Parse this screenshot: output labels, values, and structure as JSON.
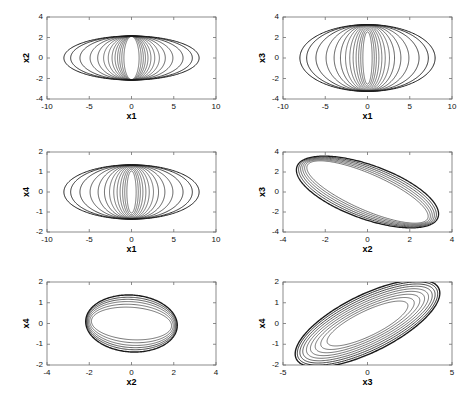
{
  "figure": {
    "width": 471,
    "height": 401,
    "background": "#ffffff",
    "line_color": "#1a1a1a",
    "axis_color": "#6f6f6f",
    "rows": 3,
    "cols": 2
  },
  "chart_data": [
    {
      "id": "panel-x1-x2",
      "type": "line",
      "title": "",
      "xlabel": "x1",
      "ylabel": "x2",
      "xlim": [
        -10,
        10
      ],
      "ylim": [
        -4,
        4
      ],
      "xticks": [
        -10,
        -5,
        0,
        5,
        10
      ],
      "yticks": [
        -4,
        -2,
        0,
        2,
        4
      ],
      "xticklabels": [
        "-10",
        "-5",
        "0",
        "5",
        "10"
      ],
      "yticklabels": [
        "-4",
        "-2",
        "0",
        "2",
        "4"
      ],
      "grid": false,
      "legend": "none",
      "description": "Family of nested phase-plane ellipses, all sharing y semi-axis near 2.15, x semi-axis growing from 0.9 to 8.0",
      "series": [
        {
          "name": "orbit-01",
          "shape": "ellipse",
          "cx": 0,
          "cy": 0,
          "rx": 0.9,
          "ry": 2.1,
          "angle": 0,
          "lw": 0.6
        },
        {
          "name": "orbit-02",
          "shape": "ellipse",
          "cx": 0,
          "cy": 0,
          "rx": 1.15,
          "ry": 2.12,
          "angle": 0,
          "lw": 0.6
        },
        {
          "name": "orbit-03",
          "shape": "ellipse",
          "cx": 0,
          "cy": 0,
          "rx": 1.4,
          "ry": 2.13,
          "angle": 0,
          "lw": 0.6
        },
        {
          "name": "orbit-04",
          "shape": "ellipse",
          "cx": 0,
          "cy": 0,
          "rx": 1.65,
          "ry": 2.14,
          "angle": 0,
          "lw": 0.6
        },
        {
          "name": "orbit-05",
          "shape": "ellipse",
          "cx": 0,
          "cy": 0,
          "rx": 1.95,
          "ry": 2.14,
          "angle": 0,
          "lw": 0.6
        },
        {
          "name": "orbit-06",
          "shape": "ellipse",
          "cx": 0,
          "cy": 0,
          "rx": 2.3,
          "ry": 2.15,
          "angle": 0,
          "lw": 0.6
        },
        {
          "name": "orbit-07",
          "shape": "ellipse",
          "cx": 0,
          "cy": 0,
          "rx": 2.75,
          "ry": 2.15,
          "angle": 0,
          "lw": 0.6
        },
        {
          "name": "orbit-08",
          "shape": "ellipse",
          "cx": 0,
          "cy": 0,
          "rx": 3.3,
          "ry": 2.15,
          "angle": 0,
          "lw": 0.6
        },
        {
          "name": "orbit-09",
          "shape": "ellipse",
          "cx": 0,
          "cy": 0,
          "rx": 4.0,
          "ry": 2.15,
          "angle": 0,
          "lw": 0.7
        },
        {
          "name": "orbit-10",
          "shape": "ellipse",
          "cx": 0,
          "cy": 0,
          "rx": 4.9,
          "ry": 2.15,
          "angle": 0,
          "lw": 0.7
        },
        {
          "name": "orbit-11",
          "shape": "ellipse",
          "cx": 0,
          "cy": 0,
          "rx": 6.1,
          "ry": 2.15,
          "angle": 0,
          "lw": 0.8
        },
        {
          "name": "orbit-12",
          "shape": "ellipse",
          "cx": 0,
          "cy": 0,
          "rx": 7.2,
          "ry": 2.15,
          "angle": 0,
          "lw": 0.9
        },
        {
          "name": "orbit-13",
          "shape": "ellipse",
          "cx": 0,
          "cy": 0,
          "rx": 8.0,
          "ry": 2.15,
          "angle": 0,
          "lw": 1.0
        }
      ]
    },
    {
      "id": "panel-x1-x3",
      "type": "line",
      "title": "",
      "xlabel": "x1",
      "ylabel": "x3",
      "xlim": [
        -10,
        10
      ],
      "ylim": [
        -4,
        4
      ],
      "xticks": [
        -10,
        -5,
        0,
        5,
        10
      ],
      "yticks": [
        -4,
        -2,
        0,
        2,
        4
      ],
      "xticklabels": [
        "-10",
        "-5",
        "0",
        "5",
        "10"
      ],
      "yticklabels": [
        "-4",
        "-2",
        "0",
        "2",
        "4"
      ],
      "grid": false,
      "legend": "none",
      "description": "Nested ellipses sharing y semi-axis near 3.25, x semi-axis growing from 0.55 to 8.0",
      "series": [
        {
          "name": "orbit-01",
          "shape": "ellipse",
          "cx": 0,
          "cy": 0,
          "rx": 0.55,
          "ry": 2.55,
          "angle": 0,
          "lw": 0.6
        },
        {
          "name": "orbit-02",
          "shape": "ellipse",
          "cx": 0,
          "cy": 0,
          "rx": 0.8,
          "ry": 2.75,
          "angle": 0,
          "lw": 0.6
        },
        {
          "name": "orbit-03",
          "shape": "ellipse",
          "cx": 0,
          "cy": 0,
          "rx": 1.05,
          "ry": 2.92,
          "angle": 0,
          "lw": 0.6
        },
        {
          "name": "orbit-04",
          "shape": "ellipse",
          "cx": 0,
          "cy": 0,
          "rx": 1.35,
          "ry": 3.05,
          "angle": 0,
          "lw": 0.6
        },
        {
          "name": "orbit-05",
          "shape": "ellipse",
          "cx": 0,
          "cy": 0,
          "rx": 1.7,
          "ry": 3.13,
          "angle": 0,
          "lw": 0.6
        },
        {
          "name": "orbit-06",
          "shape": "ellipse",
          "cx": 0,
          "cy": 0,
          "rx": 2.1,
          "ry": 3.18,
          "angle": 0,
          "lw": 0.6
        },
        {
          "name": "orbit-07",
          "shape": "ellipse",
          "cx": 0,
          "cy": 0,
          "rx": 2.6,
          "ry": 3.21,
          "angle": 0,
          "lw": 0.6
        },
        {
          "name": "orbit-08",
          "shape": "ellipse",
          "cx": 0,
          "cy": 0,
          "rx": 3.2,
          "ry": 3.23,
          "angle": 0,
          "lw": 0.7
        },
        {
          "name": "orbit-09",
          "shape": "ellipse",
          "cx": 0,
          "cy": 0,
          "rx": 3.95,
          "ry": 3.24,
          "angle": 0,
          "lw": 0.7
        },
        {
          "name": "orbit-10",
          "shape": "ellipse",
          "cx": 0,
          "cy": 0,
          "rx": 4.9,
          "ry": 3.25,
          "angle": 0,
          "lw": 0.7
        },
        {
          "name": "orbit-11",
          "shape": "ellipse",
          "cx": 0,
          "cy": 0,
          "rx": 6.1,
          "ry": 3.25,
          "angle": 0,
          "lw": 0.8
        },
        {
          "name": "orbit-12",
          "shape": "ellipse",
          "cx": 0,
          "cy": 0,
          "rx": 7.2,
          "ry": 3.26,
          "angle": 0,
          "lw": 0.9
        },
        {
          "name": "orbit-13",
          "shape": "ellipse",
          "cx": 0,
          "cy": 0,
          "rx": 8.0,
          "ry": 3.26,
          "angle": 0,
          "lw": 1.0
        }
      ]
    },
    {
      "id": "panel-x1-x4",
      "type": "line",
      "title": "",
      "xlabel": "x1",
      "ylabel": "x4",
      "xlim": [
        -10,
        10
      ],
      "ylim": [
        -2,
        2
      ],
      "xticks": [
        -10,
        -5,
        0,
        5,
        10
      ],
      "yticks": [
        -2,
        -1,
        0,
        1,
        2
      ],
      "xticklabels": [
        "-10",
        "-5",
        "0",
        "5",
        "10"
      ],
      "yticklabels": [
        "-2",
        "-1",
        "0",
        "1",
        "2"
      ],
      "grid": false,
      "legend": "none",
      "description": "Nested ellipses sharing y semi-axis near 1.35, x semi-axis growing from 0.55 to 8.0",
      "series": [
        {
          "name": "orbit-01",
          "shape": "ellipse",
          "cx": 0,
          "cy": 0,
          "rx": 0.55,
          "ry": 1.05,
          "angle": 0,
          "lw": 0.6
        },
        {
          "name": "orbit-02",
          "shape": "ellipse",
          "cx": 0,
          "cy": 0,
          "rx": 0.8,
          "ry": 1.14,
          "angle": 0,
          "lw": 0.6
        },
        {
          "name": "orbit-03",
          "shape": "ellipse",
          "cx": 0,
          "cy": 0,
          "rx": 1.05,
          "ry": 1.21,
          "angle": 0,
          "lw": 0.6
        },
        {
          "name": "orbit-04",
          "shape": "ellipse",
          "cx": 0,
          "cy": 0,
          "rx": 1.35,
          "ry": 1.26,
          "angle": 0,
          "lw": 0.6
        },
        {
          "name": "orbit-05",
          "shape": "ellipse",
          "cx": 0,
          "cy": 0,
          "rx": 1.7,
          "ry": 1.3,
          "angle": 0,
          "lw": 0.6
        },
        {
          "name": "orbit-06",
          "shape": "ellipse",
          "cx": 0,
          "cy": 0,
          "rx": 2.1,
          "ry": 1.32,
          "angle": 0,
          "lw": 0.6
        },
        {
          "name": "orbit-07",
          "shape": "ellipse",
          "cx": 0,
          "cy": 0,
          "rx": 2.6,
          "ry": 1.33,
          "angle": 0,
          "lw": 0.6
        },
        {
          "name": "orbit-08",
          "shape": "ellipse",
          "cx": 0,
          "cy": 0,
          "rx": 3.2,
          "ry": 1.34,
          "angle": 0,
          "lw": 0.7
        },
        {
          "name": "orbit-09",
          "shape": "ellipse",
          "cx": 0,
          "cy": 0,
          "rx": 3.95,
          "ry": 1.35,
          "angle": 0,
          "lw": 0.7
        },
        {
          "name": "orbit-10",
          "shape": "ellipse",
          "cx": 0,
          "cy": 0,
          "rx": 4.9,
          "ry": 1.35,
          "angle": 0,
          "lw": 0.7
        },
        {
          "name": "orbit-11",
          "shape": "ellipse",
          "cx": 0,
          "cy": 0,
          "rx": 6.1,
          "ry": 1.35,
          "angle": 0,
          "lw": 0.8
        },
        {
          "name": "orbit-12",
          "shape": "ellipse",
          "cx": 0,
          "cy": 0,
          "rx": 7.2,
          "ry": 1.36,
          "angle": 0,
          "lw": 0.9
        },
        {
          "name": "orbit-13",
          "shape": "ellipse",
          "cx": 0,
          "cy": 0,
          "rx": 8.0,
          "ry": 1.36,
          "angle": 0,
          "lw": 1.0
        }
      ]
    },
    {
      "id": "panel-x2-x3",
      "type": "line",
      "title": "",
      "xlabel": "x2",
      "ylabel": "x3",
      "xlim": [
        -4,
        4
      ],
      "ylim": [
        -4,
        4
      ],
      "xticks": [
        -4,
        -2,
        0,
        2,
        4
      ],
      "yticks": [
        -4,
        -2,
        0,
        2,
        4
      ],
      "xticklabels": [
        "-4",
        "-2",
        "0",
        "2",
        "4"
      ],
      "yticklabels": [
        "-4",
        "-2",
        "0",
        "2",
        "4"
      ],
      "grid": false,
      "legend": "none",
      "description": "Tight family of tilted nested ellipses, positive tilt about 48 degrees, major semi-axis 2.6-4.4",
      "series": [
        {
          "name": "orbit-01",
          "shape": "ellipse",
          "cx": 0,
          "cy": 0,
          "rx": 4.0,
          "ry": 1.4,
          "angle": -48,
          "lw": 0.6
        },
        {
          "name": "orbit-02",
          "shape": "ellipse",
          "cx": 0,
          "cy": 0,
          "rx": 4.1,
          "ry": 1.55,
          "angle": -48,
          "lw": 0.6
        },
        {
          "name": "orbit-03",
          "shape": "ellipse",
          "cx": 0,
          "cy": 0,
          "rx": 4.18,
          "ry": 1.7,
          "angle": -48,
          "lw": 0.6
        },
        {
          "name": "orbit-04",
          "shape": "ellipse",
          "cx": 0,
          "cy": 0,
          "rx": 4.26,
          "ry": 1.85,
          "angle": -48,
          "lw": 0.7
        },
        {
          "name": "orbit-05",
          "shape": "ellipse",
          "cx": 0,
          "cy": 0,
          "rx": 4.34,
          "ry": 2.0,
          "angle": -48,
          "lw": 0.8
        },
        {
          "name": "orbit-06",
          "shape": "ellipse",
          "cx": 0,
          "cy": 0,
          "rx": 4.42,
          "ry": 2.16,
          "angle": -48,
          "lw": 1.3
        }
      ]
    },
    {
      "id": "panel-x2-x4",
      "type": "line",
      "title": "",
      "xlabel": "x2",
      "ylabel": "x4",
      "xlim": [
        -4,
        4
      ],
      "ylim": [
        -2,
        2
      ],
      "xticks": [
        -4,
        -2,
        0,
        2,
        4
      ],
      "yticks": [
        -2,
        -1,
        0,
        1,
        2
      ],
      "xticklabels": [
        "-4",
        "-2",
        "0",
        "2",
        "4"
      ],
      "yticklabels": [
        "-2",
        "-1",
        "0",
        "1",
        "2"
      ],
      "grid": false,
      "legend": "none",
      "description": "Nearly axis-aligned nested ellipses, slight positive tilt, x semi-axis about 2.15, y semi-axis 1.0-1.37",
      "series": [
        {
          "name": "orbit-01",
          "shape": "ellipse",
          "cx": 0,
          "cy": 0,
          "rx": 1.9,
          "ry": 0.78,
          "angle": -4,
          "lw": 0.6
        },
        {
          "name": "orbit-02",
          "shape": "ellipse",
          "cx": 0,
          "cy": 0,
          "rx": 1.98,
          "ry": 0.92,
          "angle": -4,
          "lw": 0.6
        },
        {
          "name": "orbit-03",
          "shape": "ellipse",
          "cx": 0,
          "cy": 0,
          "rx": 2.04,
          "ry": 1.05,
          "angle": -4,
          "lw": 0.6
        },
        {
          "name": "orbit-04",
          "shape": "ellipse",
          "cx": 0,
          "cy": 0,
          "rx": 2.09,
          "ry": 1.16,
          "angle": -4,
          "lw": 0.7
        },
        {
          "name": "orbit-05",
          "shape": "ellipse",
          "cx": 0,
          "cy": 0,
          "rx": 2.13,
          "ry": 1.26,
          "angle": -4,
          "lw": 0.8
        },
        {
          "name": "orbit-06",
          "shape": "ellipse",
          "cx": 0,
          "cy": 0,
          "rx": 2.17,
          "ry": 1.37,
          "angle": -4,
          "lw": 1.4
        }
      ]
    },
    {
      "id": "panel-x3-x4",
      "type": "line",
      "title": "",
      "xlabel": "x3",
      "ylabel": "x4",
      "xlim": [
        -5,
        5
      ],
      "ylim": [
        -2,
        2
      ],
      "xticks": [
        -5,
        0,
        5
      ],
      "yticks": [
        -2,
        -1,
        0,
        1,
        2
      ],
      "xticklabels": [
        "-5",
        "0",
        "5"
      ],
      "yticklabels": [
        "-2",
        "-1",
        "0",
        "1",
        "2"
      ],
      "grid": false,
      "legend": "none",
      "description": "Nested ellipses with negative tilt about 22 degrees, major semi-axis growing 2.5 to 4.5",
      "series": [
        {
          "name": "orbit-01",
          "shape": "ellipse",
          "cx": 0,
          "cy": 0,
          "rx": 2.55,
          "ry": 0.62,
          "angle": 21,
          "lw": 0.6
        },
        {
          "name": "orbit-02",
          "shape": "ellipse",
          "cx": 0,
          "cy": 0,
          "rx": 2.95,
          "ry": 0.72,
          "angle": 21,
          "lw": 0.6
        },
        {
          "name": "orbit-03",
          "shape": "ellipse",
          "cx": 0,
          "cy": 0,
          "rx": 3.3,
          "ry": 0.82,
          "angle": 21,
          "lw": 0.6
        },
        {
          "name": "orbit-04",
          "shape": "ellipse",
          "cx": 0,
          "cy": 0,
          "rx": 3.6,
          "ry": 0.92,
          "angle": 21,
          "lw": 0.6
        },
        {
          "name": "orbit-05",
          "shape": "ellipse",
          "cx": 0,
          "cy": 0,
          "rx": 3.85,
          "ry": 1.02,
          "angle": 21,
          "lw": 0.6
        },
        {
          "name": "orbit-06",
          "shape": "ellipse",
          "cx": 0,
          "cy": 0,
          "rx": 4.08,
          "ry": 1.12,
          "angle": 21,
          "lw": 0.7
        },
        {
          "name": "orbit-07",
          "shape": "ellipse",
          "cx": 0,
          "cy": 0,
          "rx": 4.26,
          "ry": 1.22,
          "angle": 21,
          "lw": 0.8
        },
        {
          "name": "orbit-08",
          "shape": "ellipse",
          "cx": 0,
          "cy": 0,
          "rx": 4.42,
          "ry": 1.32,
          "angle": 21,
          "lw": 0.9
        },
        {
          "name": "orbit-09",
          "shape": "ellipse",
          "cx": 0,
          "cy": 0,
          "rx": 4.55,
          "ry": 1.42,
          "angle": 21,
          "lw": 1.4
        }
      ]
    }
  ],
  "layout": {
    "panels": [
      {
        "id": "panel-x1-x2",
        "left": 47,
        "top": 17,
        "width": 169,
        "height": 82
      },
      {
        "id": "panel-x1-x3",
        "left": 283,
        "top": 17,
        "width": 169,
        "height": 82
      },
      {
        "id": "panel-x1-x4",
        "left": 47,
        "top": 152,
        "width": 169,
        "height": 80
      },
      {
        "id": "panel-x2-x3",
        "left": 283,
        "top": 152,
        "width": 169,
        "height": 80
      },
      {
        "id": "panel-x2-x4",
        "left": 47,
        "top": 282,
        "width": 169,
        "height": 83
      },
      {
        "id": "panel-x3-x4",
        "left": 283,
        "top": 282,
        "width": 169,
        "height": 83
      }
    ]
  }
}
